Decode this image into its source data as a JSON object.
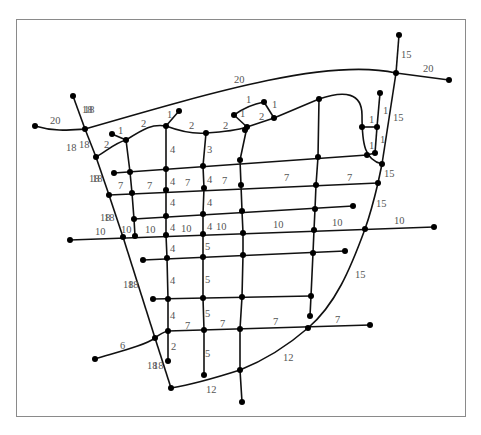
{
  "diagram": {
    "type": "weighted-street-network-graph",
    "colors": {
      "edge": "#111111",
      "node": "#000000",
      "label": "#555555",
      "frame": "#8a8a8a",
      "background": "#ffffff"
    },
    "nodes": [
      {
        "id": "n1",
        "x": 73,
        "y": 96
      },
      {
        "id": "n2",
        "x": 35,
        "y": 126
      },
      {
        "id": "n3",
        "x": 85,
        "y": 129
      },
      {
        "id": "n4",
        "x": 96,
        "y": 157
      },
      {
        "id": "n5",
        "x": 112,
        "y": 134
      },
      {
        "id": "n6",
        "x": 126,
        "y": 140
      },
      {
        "id": "n7",
        "x": 179,
        "y": 111
      },
      {
        "id": "n8",
        "x": 166,
        "y": 126
      },
      {
        "id": "n9",
        "x": 206,
        "y": 133
      },
      {
        "id": "n10",
        "x": 234,
        "y": 115
      },
      {
        "id": "n11",
        "x": 264,
        "y": 102
      },
      {
        "id": "n12",
        "x": 247,
        "y": 127
      },
      {
        "id": "n13",
        "x": 274,
        "y": 118
      },
      {
        "id": "n14",
        "x": 319,
        "y": 99
      },
      {
        "id": "n15",
        "x": 399,
        "y": 35
      },
      {
        "id": "n16",
        "x": 396,
        "y": 73
      },
      {
        "id": "n17",
        "x": 449,
        "y": 80
      },
      {
        "id": "n18",
        "x": 380,
        "y": 93
      },
      {
        "id": "n19",
        "x": 362,
        "y": 127
      },
      {
        "id": "n20",
        "x": 377,
        "y": 127
      },
      {
        "id": "n21",
        "x": 367,
        "y": 155
      },
      {
        "id": "n22",
        "x": 375,
        "y": 153
      },
      {
        "id": "n23",
        "x": 382,
        "y": 164
      },
      {
        "id": "n24",
        "x": 114,
        "y": 173
      },
      {
        "id": "n25",
        "x": 130,
        "y": 172
      },
      {
        "id": "n26",
        "x": 166,
        "y": 169
      },
      {
        "id": "n27",
        "x": 203,
        "y": 166
      },
      {
        "id": "n28",
        "x": 318,
        "y": 157
      },
      {
        "id": "n29",
        "x": 109,
        "y": 195
      },
      {
        "id": "n30",
        "x": 132,
        "y": 193
      },
      {
        "id": "n31",
        "x": 166,
        "y": 190
      },
      {
        "id": "n32",
        "x": 204,
        "y": 188
      },
      {
        "id": "n33",
        "x": 316,
        "y": 185
      },
      {
        "id": "n34",
        "x": 378,
        "y": 183
      },
      {
        "id": "n35",
        "x": 134,
        "y": 219
      },
      {
        "id": "n36",
        "x": 166,
        "y": 216
      },
      {
        "id": "n37",
        "x": 203,
        "y": 214
      },
      {
        "id": "n38",
        "x": 315,
        "y": 209
      },
      {
        "id": "n39",
        "x": 353,
        "y": 206
      },
      {
        "id": "n40",
        "x": 70,
        "y": 240
      },
      {
        "id": "n41",
        "x": 123,
        "y": 237
      },
      {
        "id": "n42",
        "x": 135,
        "y": 236
      },
      {
        "id": "n43",
        "x": 166,
        "y": 235
      },
      {
        "id": "n44",
        "x": 203,
        "y": 234
      },
      {
        "id": "n45",
        "x": 314,
        "y": 230
      },
      {
        "id": "n46",
        "x": 365,
        "y": 229
      },
      {
        "id": "n47",
        "x": 434,
        "y": 227
      },
      {
        "id": "n48",
        "x": 143,
        "y": 260
      },
      {
        "id": "n49",
        "x": 167,
        "y": 258
      },
      {
        "id": "n50",
        "x": 203,
        "y": 257
      },
      {
        "id": "n51",
        "x": 243,
        "y": 255
      },
      {
        "id": "n52",
        "x": 313,
        "y": 253
      },
      {
        "id": "n53",
        "x": 345,
        "y": 251
      },
      {
        "id": "n54",
        "x": 153,
        "y": 299
      },
      {
        "id": "n55",
        "x": 168,
        "y": 299
      },
      {
        "id": "n56",
        "x": 203,
        "y": 298
      },
      {
        "id": "n57",
        "x": 242,
        "y": 297
      },
      {
        "id": "n58",
        "x": 311,
        "y": 296
      },
      {
        "id": "n59",
        "x": 310,
        "y": 316
      },
      {
        "id": "n60",
        "x": 95,
        "y": 359
      },
      {
        "id": "n61",
        "x": 155,
        "y": 338
      },
      {
        "id": "n62",
        "x": 168,
        "y": 331
      },
      {
        "id": "n63",
        "x": 204,
        "y": 330
      },
      {
        "id": "n64",
        "x": 240,
        "y": 329
      },
      {
        "id": "n65",
        "x": 308,
        "y": 328
      },
      {
        "id": "n66",
        "x": 370,
        "y": 325
      },
      {
        "id": "n67",
        "x": 168,
        "y": 361
      },
      {
        "id": "n68",
        "x": 204,
        "y": 375
      },
      {
        "id": "n69",
        "x": 171,
        "y": 388
      },
      {
        "id": "n70",
        "x": 240,
        "y": 370
      },
      {
        "id": "n71",
        "x": 242,
        "y": 402
      },
      {
        "id": "n72",
        "x": 245,
        "y": 130
      },
      {
        "id": "n73",
        "x": 240,
        "y": 160
      },
      {
        "id": "n74",
        "x": 241,
        "y": 185
      },
      {
        "id": "n75",
        "x": 242,
        "y": 211
      },
      {
        "id": "n76",
        "x": 243,
        "y": 233
      }
    ],
    "edges": [
      {
        "d": "M35,126 C55,132 70,130 85,129",
        "w": "20",
        "lx": 50,
        "ly": 124
      },
      {
        "d": "M85,129 C220,90 330,58 396,73",
        "w": "20",
        "lx": 234,
        "ly": 83
      },
      {
        "d": "M396,73 L449,80",
        "w": "20",
        "lx": 423,
        "ly": 72
      },
      {
        "d": "M73,96 L85,129",
        "w": "18",
        "lx": 84,
        "ly": 113
      },
      {
        "d": "M85,129 L96,157",
        "w": "18",
        "lx": 79,
        "ly": 148
      },
      {
        "d": "M96,157 L109,195",
        "w": "18",
        "lx": 92,
        "ly": 182
      },
      {
        "d": "M109,195 L123,237",
        "w": "18",
        "lx": 104,
        "ly": 221
      },
      {
        "d": "M123,237 L155,338",
        "w": "18",
        "lx": 128,
        "ly": 288
      },
      {
        "d": "M155,338 L171,388",
        "w": "18",
        "lx": 153,
        "ly": 369
      },
      {
        "d": "M96,157 C108,150 115,143 126,140",
        "w": "2",
        "lx": 104,
        "ly": 148
      },
      {
        "d": "M112,134 L126,140",
        "w": "1",
        "lx": 118,
        "ly": 134
      },
      {
        "d": "M126,140 C145,128 152,124 166,126",
        "w": "2",
        "lx": 141,
        "ly": 127
      },
      {
        "d": "M166,126 L179,111",
        "w": "1",
        "lx": 167,
        "ly": 118
      },
      {
        "d": "M166,126 C182,132 195,134 206,133",
        "w": "2",
        "lx": 189,
        "ly": 129
      },
      {
        "d": "M206,133 C222,132 235,131 247,127",
        "w": "2",
        "lx": 223,
        "ly": 129
      },
      {
        "d": "M234,115 L247,127",
        "w": "1",
        "lx": 240,
        "ly": 117
      },
      {
        "d": "M234,115 C245,107 253,104 264,102",
        "w": "1",
        "lx": 246,
        "ly": 103
      },
      {
        "d": "M264,102 L274,118",
        "w": "1",
        "lx": 272,
        "ly": 108
      },
      {
        "d": "M247,127 L274,118",
        "w": "2",
        "lx": 259,
        "ly": 120
      },
      {
        "d": "M274,118 L319,99",
        "w": "",
        "lx": 0,
        "ly": 0
      },
      {
        "d": "M319,99 C345,90 362,93 362,115 C362,145 365,160 382,164",
        "w": "",
        "lx": 0,
        "ly": 0
      },
      {
        "d": "M362,127 L377,127",
        "w": "1",
        "lx": 369,
        "ly": 123
      },
      {
        "d": "M380,93 L377,127",
        "w": "1",
        "lx": 383,
        "ly": 114
      },
      {
        "d": "M377,127 L375,153",
        "w": "1",
        "lx": 380,
        "ly": 143
      },
      {
        "d": "M367,155 L375,153",
        "w": "1",
        "lx": 369,
        "ly": 149
      },
      {
        "d": "M399,35 L396,73",
        "w": "15",
        "lx": 401,
        "ly": 58
      },
      {
        "d": "M396,73 L382,164",
        "w": "15",
        "lx": 393,
        "ly": 121
      },
      {
        "d": "M382,164 L378,183",
        "w": "15",
        "lx": 384,
        "ly": 177
      },
      {
        "d": "M378,183 C374,200 370,215 365,229",
        "w": "15",
        "lx": 376,
        "ly": 207
      },
      {
        "d": "M365,229 C350,270 335,305 308,328",
        "w": "15",
        "lx": 355,
        "ly": 278
      },
      {
        "d": "M308,328 C285,348 265,360 240,370",
        "w": "12",
        "lx": 283,
        "ly": 361
      },
      {
        "d": "M240,370 C215,378 195,384 171,388",
        "w": "12",
        "lx": 206,
        "ly": 393
      },
      {
        "d": "M114,173 L367,155",
        "w": "",
        "lx": 0,
        "ly": 0
      },
      {
        "d": "M109,195 L378,183",
        "w": "7",
        "lx": 118,
        "ly": 189
      },
      {
        "d": "M134,219 L353,206",
        "w": "",
        "lx": 0,
        "ly": 0
      },
      {
        "d": "M70,240 L434,227",
        "w": "10",
        "lx": 95,
        "ly": 235
      },
      {
        "d": "M143,260 L345,251",
        "w": "",
        "lx": 0,
        "ly": 0
      },
      {
        "d": "M153,299 L311,296",
        "w": "",
        "lx": 0,
        "ly": 0
      },
      {
        "d": "M95,359 C125,350 145,345 155,338 C160,334 163,332 168,331 L370,325",
        "w": "6",
        "lx": 120,
        "ly": 349
      },
      {
        "d": "M126,140 L130,172 L132,193 L134,219 L135,236",
        "w": "",
        "lx": 0,
        "ly": 0
      },
      {
        "d": "M166,126 L166,235 L167,258 L168,299 L168,331 L168,361",
        "w": "",
        "lx": 0,
        "ly": 0
      },
      {
        "d": "M206,133 L203,166 L204,188 L203,214 L203,234 L203,257 L203,298 L204,330 L204,375",
        "w": "",
        "lx": 0,
        "ly": 0
      },
      {
        "d": "M247,127 L240,160 L241,185 L242,211 L243,233 L243,255 L242,297 L240,329 L240,370 L242,402",
        "w": "",
        "lx": 0,
        "ly": 0
      },
      {
        "d": "M319,99 L318,157 L316,185 L315,209 L314,230 L313,253 L311,296 L310,316",
        "w": "",
        "lx": 0,
        "ly": 0
      }
    ],
    "labels": [
      {
        "t": "4",
        "x": 170,
        "y": 153
      },
      {
        "t": "3",
        "x": 207,
        "y": 153
      },
      {
        "t": "4",
        "x": 170,
        "y": 185
      },
      {
        "t": "7",
        "x": 185,
        "y": 186
      },
      {
        "t": "4",
        "x": 207,
        "y": 183
      },
      {
        "t": "7",
        "x": 222,
        "y": 184
      },
      {
        "t": "7",
        "x": 147,
        "y": 189
      },
      {
        "t": "7",
        "x": 284,
        "y": 181
      },
      {
        "t": "7",
        "x": 347,
        "y": 181
      },
      {
        "t": "4",
        "x": 170,
        "y": 206
      },
      {
        "t": "4",
        "x": 207,
        "y": 206
      },
      {
        "t": "10",
        "x": 121,
        "y": 233
      },
      {
        "t": "10",
        "x": 145,
        "y": 233
      },
      {
        "t": "4",
        "x": 170,
        "y": 231
      },
      {
        "t": "10",
        "x": 181,
        "y": 232
      },
      {
        "t": "4",
        "x": 207,
        "y": 230
      },
      {
        "t": "10",
        "x": 216,
        "y": 230
      },
      {
        "t": "10",
        "x": 273,
        "y": 228
      },
      {
        "t": "10",
        "x": 332,
        "y": 226
      },
      {
        "t": "10",
        "x": 394,
        "y": 224
      },
      {
        "t": "4",
        "x": 170,
        "y": 252
      },
      {
        "t": "5",
        "x": 205,
        "y": 250
      },
      {
        "t": "4",
        "x": 170,
        "y": 284
      },
      {
        "t": "5",
        "x": 205,
        "y": 283
      },
      {
        "t": "4",
        "x": 170,
        "y": 319
      },
      {
        "t": "5",
        "x": 205,
        "y": 317
      },
      {
        "t": "7",
        "x": 185,
        "y": 329
      },
      {
        "t": "7",
        "x": 220,
        "y": 327
      },
      {
        "t": "7",
        "x": 273,
        "y": 325
      },
      {
        "t": "7",
        "x": 335,
        "y": 323
      },
      {
        "t": "2",
        "x": 171,
        "y": 350
      },
      {
        "t": "5",
        "x": 205,
        "y": 357
      },
      {
        "t": "18",
        "x": 82,
        "y": 113
      },
      {
        "t": "18",
        "x": 66,
        "y": 151
      },
      {
        "t": "18",
        "x": 89,
        "y": 182
      },
      {
        "t": "18",
        "x": 100,
        "y": 221
      },
      {
        "t": "18",
        "x": 123,
        "y": 288
      },
      {
        "t": "18",
        "x": 147,
        "y": 369
      }
    ]
  }
}
